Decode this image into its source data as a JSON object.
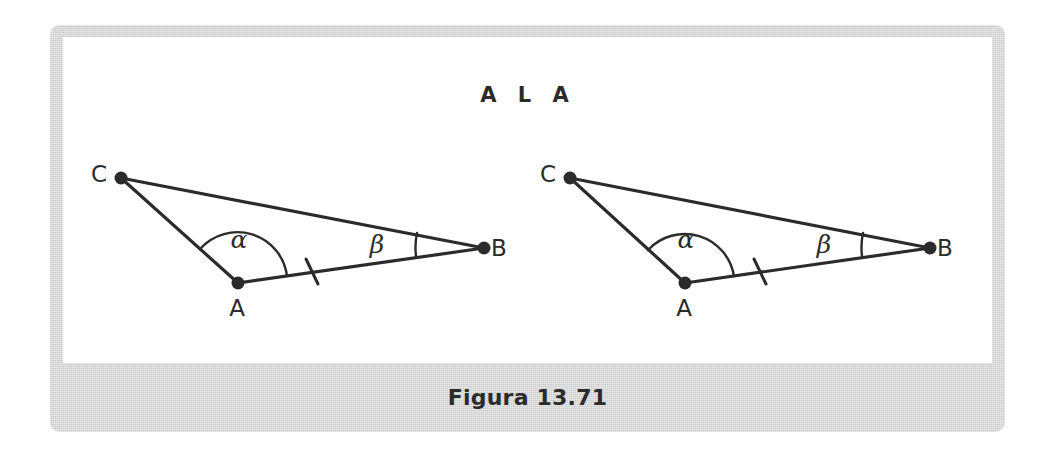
{
  "figure": {
    "title": "A L A",
    "caption": "Figura 13.71",
    "frame_color": "#d6d6d6",
    "panel_color": "#ffffff",
    "ink_color": "#2b2b2b"
  },
  "triangles": [
    {
      "id": "triangle-left",
      "vertices": {
        "C": {
          "label": "C",
          "x": 121,
          "y": 178,
          "label_x": 99,
          "label_y": 182
        },
        "A": {
          "label": "A",
          "x": 238,
          "y": 283,
          "label_x": 237,
          "label_y": 316
        },
        "B": {
          "label": "B",
          "x": 484,
          "y": 248,
          "label_x": 499,
          "label_y": 256
        }
      },
      "angles": [
        {
          "name": "alpha",
          "label": "α",
          "at": "A",
          "label_x": 239,
          "label_y": 248
        },
        {
          "name": "beta",
          "label": "β",
          "at": "B",
          "label_x": 377,
          "label_y": 253
        }
      ],
      "tick": {
        "name": "congruent-side-tick",
        "side": "AB",
        "x": 312,
        "y": 271
      }
    },
    {
      "id": "triangle-right",
      "vertices": {
        "C": {
          "label": "C",
          "x": 570,
          "y": 178,
          "label_x": 548,
          "label_y": 182
        },
        "A": {
          "label": "A",
          "x": 685,
          "y": 283,
          "label_x": 684,
          "label_y": 316
        },
        "B": {
          "label": "B",
          "x": 930,
          "y": 248,
          "label_x": 945,
          "label_y": 256
        }
      },
      "angles": [
        {
          "name": "alpha",
          "label": "α",
          "at": "A",
          "label_x": 686,
          "label_y": 248
        },
        {
          "name": "beta",
          "label": "β",
          "at": "B",
          "label_x": 824,
          "label_y": 253
        }
      ],
      "tick": {
        "name": "congruent-side-tick",
        "side": "AB",
        "x": 760,
        "y": 271
      }
    }
  ],
  "title_position": {
    "x": 528,
    "y": 102
  },
  "chart_data": {
    "type": "diagram",
    "title": "A L A",
    "subtitle": "Figura 13.71",
    "shapes": [
      {
        "name": "triangle-left",
        "points": [
          [
            121,
            178
          ],
          [
            238,
            283
          ],
          [
            484,
            248
          ]
        ],
        "point_labels": [
          "C",
          "A",
          "B"
        ],
        "marked_angles": [
          "alpha at A",
          "beta at B"
        ],
        "marked_sides": [
          "AB single tick"
        ]
      },
      {
        "name": "triangle-right",
        "points": [
          [
            570,
            178
          ],
          [
            685,
            283
          ],
          [
            930,
            248
          ]
        ],
        "point_labels": [
          "C",
          "A",
          "B"
        ],
        "marked_angles": [
          "alpha at A",
          "beta at B"
        ],
        "marked_sides": [
          "AB single tick"
        ]
      }
    ]
  }
}
